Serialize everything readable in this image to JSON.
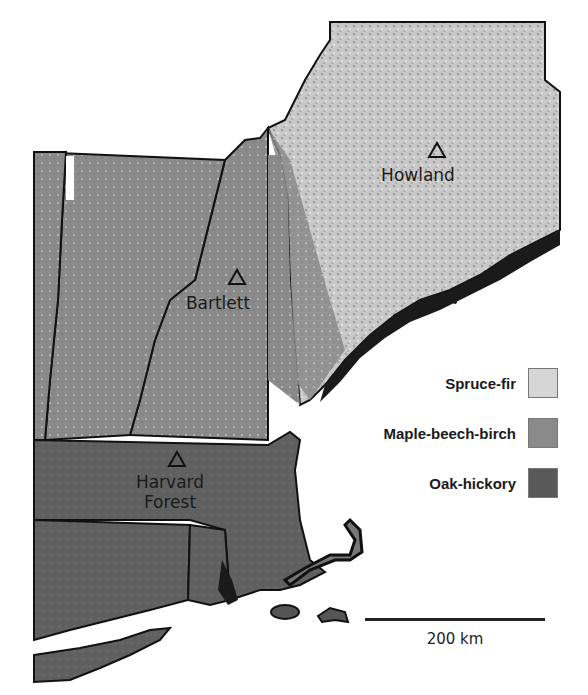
{
  "map": {
    "region": "New England",
    "sites": [
      {
        "name": "Howland",
        "label": "Howland"
      },
      {
        "name": "Bartlett",
        "label": "Bartlett"
      },
      {
        "name": "Harvard Forest",
        "label_line1": "Harvard",
        "label_line2": "Forest"
      }
    ],
    "legend": {
      "items": [
        {
          "label": "Spruce-fir",
          "color": "#d6d6d6"
        },
        {
          "label": "Maple-beech-birch",
          "color": "#8a8a8a"
        },
        {
          "label": "Oak-hickory",
          "color": "#595959"
        }
      ]
    },
    "scale_bar": {
      "label": "200 km"
    },
    "colors": {
      "spruce_fir": "#cfcfcf",
      "maple_beech_birch": "#8a8a8a",
      "oak_hickory": "#5e5e5e",
      "coast": "#1a1a1a",
      "water": "#ffffff",
      "border": "#111111"
    }
  }
}
